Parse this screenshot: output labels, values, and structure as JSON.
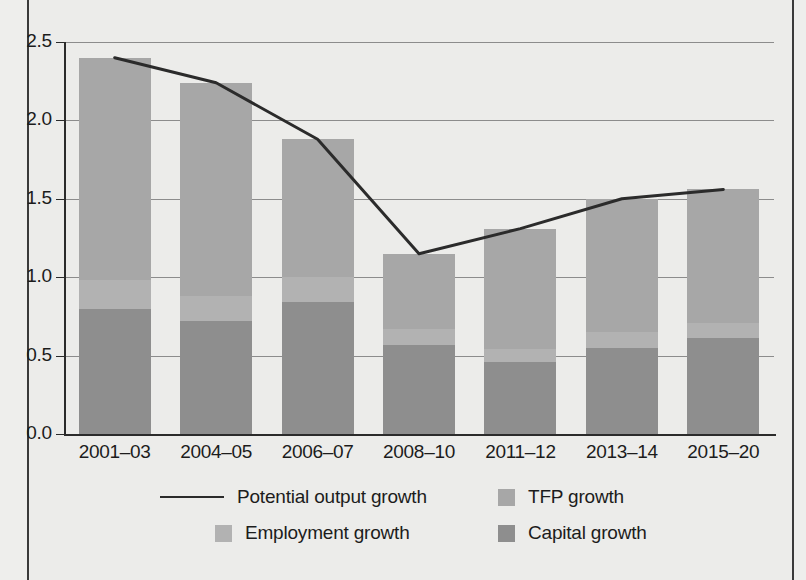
{
  "chart_data": {
    "type": "bar",
    "title": "",
    "subtitle": "",
    "xlabel": "",
    "ylabel": "",
    "ylim": [
      0.0,
      2.5
    ],
    "yticks": [
      "0.0",
      "0.5",
      "1.0",
      "1.5",
      "2.0",
      "2.5"
    ],
    "ytick_values": [
      0.0,
      0.5,
      1.0,
      1.5,
      2.0,
      2.5
    ],
    "grid": true,
    "legend_position": "bottom",
    "stacked": true,
    "categories": [
      "2001–03",
      "2004–05",
      "2006–07",
      "2008–10",
      "2011–12",
      "2013–14",
      "2015–20"
    ],
    "series": [
      {
        "name": "Capital growth",
        "type": "bar",
        "color": "#8e8e8e",
        "values": [
          0.8,
          0.72,
          0.84,
          0.57,
          0.46,
          0.55,
          0.61
        ]
      },
      {
        "name": "Employment growth",
        "type": "bar",
        "color": "#b2b2b2",
        "values": [
          0.18,
          0.16,
          0.16,
          0.1,
          0.08,
          0.1,
          0.1
        ]
      },
      {
        "name": "TFP growth",
        "type": "bar",
        "color": "#a7a7a7",
        "values": [
          1.42,
          1.36,
          0.88,
          0.48,
          0.77,
          0.85,
          0.85
        ]
      },
      {
        "name": "Potential output growth",
        "type": "line",
        "color": "#2b2b2b",
        "values": [
          2.4,
          2.24,
          1.88,
          1.15,
          1.31,
          1.5,
          1.56
        ]
      }
    ],
    "bar_totals": [
      2.4,
      2.24,
      1.88,
      1.15,
      1.31,
      1.5,
      1.56
    ]
  },
  "legend": {
    "items": [
      {
        "label": "Potential output growth",
        "marker": "line",
        "color": "#2b2b2b"
      },
      {
        "label": "TFP growth",
        "marker": "swatch",
        "color": "#a7a7a7"
      },
      {
        "label": "Employment growth",
        "marker": "swatch",
        "color": "#b2b2b2"
      },
      {
        "label": "Capital growth",
        "marker": "swatch",
        "color": "#8e8e8e"
      }
    ]
  },
  "colors": {
    "background": "#ececea",
    "axis": "#2b2b2b",
    "grid": "#8c8c8c",
    "tfp": "#a7a7a7",
    "employment": "#b2b2b2",
    "capital": "#8e8e8e",
    "line": "#2b2b2b"
  }
}
